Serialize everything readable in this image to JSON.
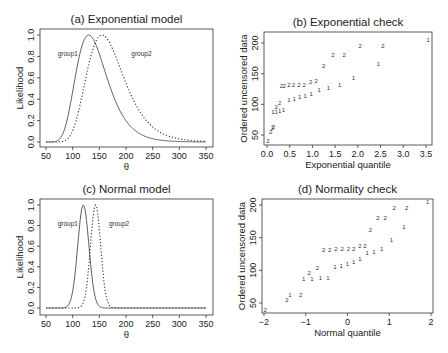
{
  "figure": {
    "background": "#ffffff",
    "line_color": "#333333"
  },
  "chart_data": [
    {
      "id": "a",
      "type": "line",
      "title": "(a) Exponential model",
      "xlabel": "θ",
      "ylabel": "Likelihood",
      "xlim": [
        50,
        350
      ],
      "ylim": [
        0,
        1
      ],
      "xticks": [
        50,
        100,
        150,
        200,
        250,
        300,
        350
      ],
      "yticks": [
        "0.0",
        "0.2",
        "0.4",
        "0.6",
        "0.8",
        "1.0"
      ],
      "grid": false,
      "annotations": [
        {
          "text": "group1",
          "x": 72,
          "y": 0.8
        },
        {
          "text": "group2",
          "x": 210,
          "y": 0.8
        }
      ],
      "series": [
        {
          "name": "group1",
          "style": "solid",
          "model": "exponential",
          "mode": 130,
          "n": 20
        },
        {
          "name": "group2",
          "style": "dotted",
          "model": "exponential",
          "mode": 155,
          "n": 20
        }
      ],
      "box": {
        "x0": 40,
        "y0": 29,
        "x1": 213,
        "y1": 147
      },
      "map": {
        "x50": 46,
        "x350": 206,
        "y0": 142,
        "y1": 35
      }
    },
    {
      "id": "b",
      "type": "scatter",
      "title": "(b) Exponential check",
      "xlabel": "Exponential quantile",
      "ylabel": "Ordered uncensored data",
      "xticks": [
        "0.0",
        "0.5",
        "1.0",
        "1.5",
        "2.0",
        "2.5",
        "3.0",
        "3.5"
      ],
      "yticks": [
        50,
        100,
        150,
        200
      ],
      "grid": false,
      "series": [
        {
          "name": "1",
          "points": [
            [
              0.13,
              87
            ],
            [
              0.2,
              88
            ],
            [
              0.28,
              89
            ],
            [
              0.36,
              91
            ],
            [
              0.48,
              107
            ],
            [
              0.6,
              109
            ],
            [
              0.72,
              112
            ],
            [
              0.84,
              114
            ],
            [
              0.97,
              117
            ],
            [
              1.15,
              124
            ],
            [
              1.35,
              126
            ],
            [
              1.6,
              131
            ],
            [
              1.9,
              143
            ],
            [
              2.45,
              166
            ],
            [
              3.55,
              205
            ]
          ]
        },
        {
          "name": "2",
          "points": [
            [
              0.02,
              40
            ],
            [
              0.08,
              55
            ],
            [
              0.12,
              61
            ],
            [
              0.14,
              63
            ],
            [
              0.2,
              95
            ],
            [
              0.28,
              102
            ],
            [
              0.32,
              130
            ],
            [
              0.38,
              130
            ],
            [
              0.48,
              131
            ],
            [
              0.58,
              131
            ],
            [
              0.7,
              131
            ],
            [
              0.82,
              131
            ],
            [
              0.96,
              137
            ],
            [
              1.08,
              138
            ],
            [
              1.25,
              162
            ],
            [
              1.45,
              180
            ],
            [
              1.7,
              180
            ],
            [
              2.05,
              195
            ],
            [
              2.55,
              195
            ]
          ]
        }
      ],
      "box": {
        "x0": 264,
        "y0": 32,
        "x1": 432,
        "y1": 145
      },
      "map": {
        "xmin_val": 0,
        "xmin_px": 267,
        "xmax_val": 3.5,
        "xmax_px": 426,
        "ymin_val": 50,
        "ymin_px": 135,
        "ymax_val": 200,
        "ymax_px": 43
      }
    },
    {
      "id": "c",
      "type": "line",
      "title": "(c) Normal model",
      "xlabel": "θ",
      "ylabel": "Likelihood",
      "xlim": [
        50,
        350
      ],
      "ylim": [
        0,
        1
      ],
      "xticks": [
        50,
        100,
        150,
        200,
        250,
        300,
        350
      ],
      "yticks": [
        "0.0",
        "0.2",
        "0.4",
        "0.6",
        "0.8",
        "1.0"
      ],
      "grid": false,
      "annotations": [
        {
          "text": "group1",
          "x": 72,
          "y": 0.8
        },
        {
          "text": "group2",
          "x": 168,
          "y": 0.8
        }
      ],
      "series": [
        {
          "name": "group1",
          "style": "solid",
          "model": "normal",
          "mean": 120,
          "sd": 10.5
        },
        {
          "name": "group2",
          "style": "dotted",
          "model": "normal",
          "mean": 143,
          "sd": 9.5
        }
      ],
      "box": {
        "x0": 40,
        "y0": 199,
        "x1": 213,
        "y1": 315
      },
      "map": {
        "x50": 46,
        "x350": 206,
        "y0": 308,
        "y1": 205
      }
    },
    {
      "id": "d",
      "type": "scatter",
      "title": "(d) Normality check",
      "xlabel": "Normal quantile",
      "ylabel": "Ordered uncensored data",
      "xticks": [
        "−2",
        "−1",
        "0",
        "1",
        "2"
      ],
      "yticks": [
        50,
        100,
        150,
        200
      ],
      "grid": false,
      "series": [
        {
          "name": "1",
          "points": [
            [
              -1.38,
              63
            ],
            [
              -1.05,
              87
            ],
            [
              -0.85,
              87
            ],
            [
              -0.65,
              88
            ],
            [
              -0.47,
              89
            ],
            [
              -0.3,
              105
            ],
            [
              -0.15,
              107
            ],
            [
              0.0,
              110
            ],
            [
              0.15,
              113
            ],
            [
              0.3,
              117
            ],
            [
              0.47,
              127
            ],
            [
              0.63,
              128
            ],
            [
              0.82,
              132
            ],
            [
              1.05,
              146
            ],
            [
              1.35,
              166
            ],
            [
              1.92,
              205
            ]
          ]
        },
        {
          "name": "2",
          "points": [
            [
              -1.97,
              40
            ],
            [
              -1.45,
              55
            ],
            [
              -1.12,
              62
            ],
            [
              -0.92,
              96
            ],
            [
              -0.72,
              103
            ],
            [
              -0.57,
              131
            ],
            [
              -0.43,
              131
            ],
            [
              -0.28,
              132
            ],
            [
              -0.13,
              132
            ],
            [
              0.02,
              132
            ],
            [
              0.15,
              132
            ],
            [
              0.3,
              137
            ],
            [
              0.42,
              138
            ],
            [
              0.55,
              162
            ],
            [
              0.73,
              180
            ],
            [
              0.9,
              180
            ],
            [
              1.12,
              195
            ],
            [
              1.42,
              195
            ]
          ]
        }
      ],
      "box": {
        "x0": 262,
        "y0": 199,
        "x1": 433,
        "y1": 313
      },
      "map": {
        "xmin_val": -2,
        "xmin_px": 264,
        "xmax_val": 2,
        "xmax_px": 431,
        "ymin_val": 50,
        "ymin_px": 303,
        "ymax_val": 200,
        "ymax_px": 205
      }
    }
  ]
}
